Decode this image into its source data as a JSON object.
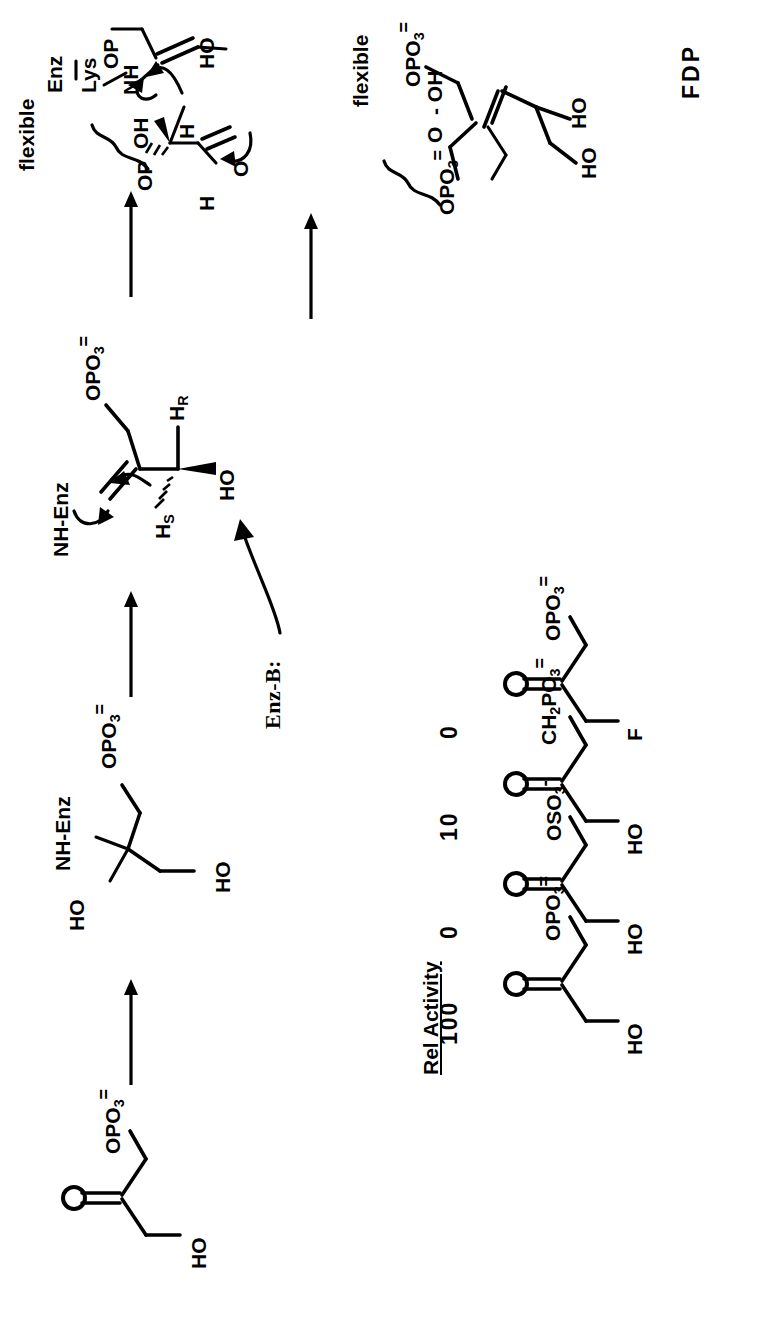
{
  "figure": {
    "kind": "enzyme-reaction-mechanism-scheme",
    "orientation": "rotated-90-ccw",
    "product_label": "FDP",
    "arrow_count": 4
  },
  "scheme": {
    "step1": {
      "name": "dihydroxyacetone-phosphate",
      "labels": {
        "ketone_o": "O",
        "hydroxyl": "HO",
        "phosphate": "OPO",
        "phosphate_sub": "3",
        "phosphate_charge": "="
      }
    },
    "step2": {
      "name": "carbinolamine",
      "labels": {
        "oh_left": "HO",
        "amine": "NH-Enz",
        "phosphate": "OPO",
        "phosphate_sub": "3",
        "phosphate_charge": "=",
        "oh_bottom": "HO"
      }
    },
    "step3": {
      "name": "iminium-enamine-formation",
      "labels": {
        "base": "Enz-B:",
        "imine": "NH-Enz",
        "phosphate": "OPO",
        "phosphate_sub": "3",
        "phosphate_charge": "=",
        "h_pro_s": "H",
        "h_pro_s_sub": "S",
        "h_pro_r": "H",
        "h_pro_r_sub": "R",
        "hydroxyl": "HO"
      }
    },
    "step4": {
      "name": "aldol-addition-transition",
      "labels": {
        "flexible": "flexible",
        "enz": "Enz",
        "lys": "Lys",
        "nh": "NH",
        "op_top": "OP",
        "oh": "OH",
        "h_aldehyde": "H",
        "h_transfer": "H",
        "o_carbonyl": "O",
        "ho": "HO",
        "op_bottom": "OP"
      }
    },
    "step5": {
      "name": "fructose-1-6-bisphosphate",
      "labels": {
        "flexible": "flexible",
        "phosphate_top": "OPO",
        "phosphate_top_sub": "3",
        "phosphate_top_charge": "=",
        "phosphate_left": "OPO",
        "phosphate_left_sub": "3",
        "phosphate_left_charge": "=",
        "oh": "OH",
        "o_carbonyl": "O",
        "ho_1": "HO",
        "ho_2": "HO",
        "product": "FDP"
      }
    }
  },
  "table": {
    "header": "Rel Activity",
    "rows": [
      {
        "left_group": "HO",
        "carbonyl": "O",
        "right_group": "OPO",
        "right_sub": "3",
        "right_charge": "=",
        "activity": "100"
      },
      {
        "left_group": "HO",
        "carbonyl": "O",
        "right_group": "OSO",
        "right_sub": "3",
        "right_charge": "-",
        "activity": "0"
      },
      {
        "left_group": "HO",
        "carbonyl": "O",
        "right_group": "CH",
        "right_sub": "2",
        "right_group2": "PO",
        "right_sub2": "3",
        "right_charge": "=",
        "activity": "10"
      },
      {
        "left_group": "F",
        "carbonyl": "O",
        "right_group": "OPO",
        "right_sub": "3",
        "right_charge": "=",
        "activity": "0"
      }
    ]
  },
  "colors": {
    "ink": "#000000",
    "paper": "#ffffff"
  }
}
